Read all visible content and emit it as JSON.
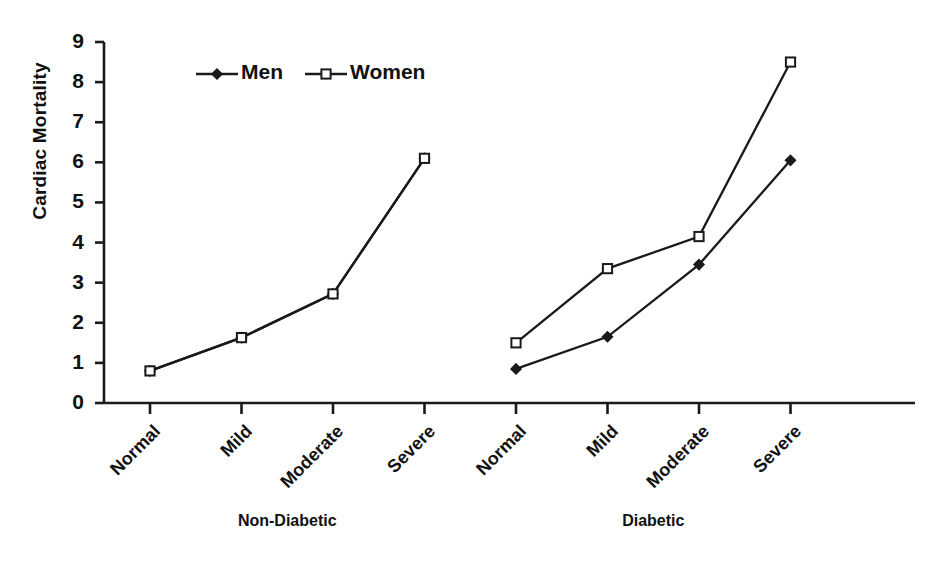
{
  "chart_data": {
    "type": "line",
    "title": "",
    "xlabel": "",
    "ylabel": "Cardiac Mortality",
    "ylim": [
      0,
      9
    ],
    "ytick_labels": [
      "0",
      "1",
      "2",
      "3",
      "4",
      "5",
      "6",
      "7",
      "8",
      "9"
    ],
    "grid": false,
    "legend_position": "top-left-inside",
    "categories": [
      "Normal",
      "Mild",
      "Moderate",
      "Severe",
      "Normal",
      "Mild",
      "Moderate",
      "Severe"
    ],
    "groups": [
      {
        "name": "Non-Diabetic",
        "categories": [
          "Normal",
          "Mild",
          "Moderate",
          "Severe"
        ]
      },
      {
        "name": "Diabetic",
        "categories": [
          "Normal",
          "Mild",
          "Moderate",
          "Severe"
        ]
      }
    ],
    "series": [
      {
        "name": "Men",
        "marker": "filled-diamond",
        "color": "#1a1a1a",
        "values": [
          0.8,
          1.63,
          2.72,
          6.1,
          0.85,
          1.65,
          3.45,
          6.05
        ]
      },
      {
        "name": "Women",
        "marker": "open-square",
        "color": "#1a1a1a",
        "values": [
          0.8,
          1.63,
          2.72,
          6.1,
          1.5,
          3.35,
          4.15,
          8.5
        ]
      }
    ]
  },
  "legend": {
    "men_label": "Men",
    "women_label": "Women"
  },
  "axis": {
    "y_title": "Cardiac Mortality"
  }
}
